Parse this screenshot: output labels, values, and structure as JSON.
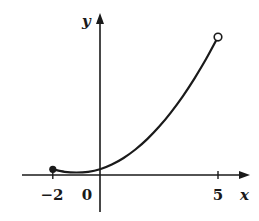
{
  "chart_data": {
    "type": "line",
    "title": "",
    "xlabel": "x",
    "ylabel": "y",
    "x_ticks": [
      {
        "value": -2,
        "label": "−2"
      },
      {
        "value": 0,
        "label": "0"
      },
      {
        "value": 5,
        "label": "5"
      }
    ],
    "series": [
      {
        "name": "f(x)",
        "x": [
          -2,
          -1.5,
          -1,
          -0.5,
          0,
          0.5,
          1,
          1.5,
          2,
          2.5,
          3,
          3.5,
          4,
          4.5,
          5
        ],
        "y": [
          0.3,
          0.17,
          0.13,
          0.17,
          0.3,
          0.55,
          0.9,
          1.35,
          1.9,
          2.55,
          3.3,
          4.15,
          5.1,
          6.15,
          7.3
        ],
        "left_endpoint": {
          "x": -2,
          "closed": true
        },
        "right_endpoint": {
          "x": 5,
          "closed": false
        }
      }
    ],
    "xlim": [
      -3.3,
      6.3
    ],
    "ylim": [
      -1.5,
      8
    ],
    "grid": false,
    "legend": null
  },
  "labels": {
    "x_axis": "x",
    "y_axis": "y",
    "tick_neg2": "−2",
    "tick_0": "0",
    "tick_5": "5"
  },
  "colors": {
    "ink": "#1a1a1a",
    "background": "#ffffff"
  }
}
